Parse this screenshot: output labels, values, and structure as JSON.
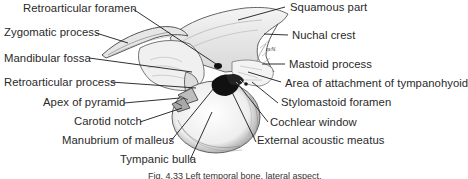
{
  "figure": {
    "type": "anatomical-illustration",
    "labels": [
      {
        "id": "retroarticular-foramen",
        "text": "Retroarticular foramen",
        "x": 23,
        "y": 2
      },
      {
        "id": "squamous-part",
        "text": "Squamous part",
        "x": 290,
        "y": 1
      },
      {
        "id": "zygomatic-process",
        "text": "Zygomatic process",
        "x": 4,
        "y": 26
      },
      {
        "id": "nuchal-crest",
        "text": "Nuchal crest",
        "x": 292,
        "y": 29
      },
      {
        "id": "mandibular-fossa",
        "text": "Mandibular fossa",
        "x": 4,
        "y": 52
      },
      {
        "id": "mastoid-process",
        "text": "Mastoid process",
        "x": 289,
        "y": 58
      },
      {
        "id": "retroarticular-process",
        "text": "Retroarticular process",
        "x": 4,
        "y": 76
      },
      {
        "id": "area-tympanohyoid",
        "text": "Area of attachment of tympanohyoid",
        "x": 285,
        "y": 77
      },
      {
        "id": "apex-of-pyramid",
        "text": "Apex of pyramid",
        "x": 43,
        "y": 96
      },
      {
        "id": "stylomastoid-foramen",
        "text": "Stylomastoid foramen",
        "x": 281,
        "y": 96
      },
      {
        "id": "carotid-notch",
        "text": "Carotid notch",
        "x": 74,
        "y": 115
      },
      {
        "id": "cochlear-window",
        "text": "Cochlear window",
        "x": 270,
        "y": 116
      },
      {
        "id": "manubrium-of-malleus",
        "text": "Manubrium of malleus",
        "x": 62,
        "y": 134
      },
      {
        "id": "external-acoustic-meatus",
        "text": "External acoustic meatus",
        "x": 257,
        "y": 134
      },
      {
        "id": "tympanic-bulla",
        "text": "Tympanic bulla",
        "x": 120,
        "y": 153
      }
    ],
    "caption": "Fig. 4.33 Left temporal bone, lateral aspect.",
    "artist_signature": "m.N."
  }
}
